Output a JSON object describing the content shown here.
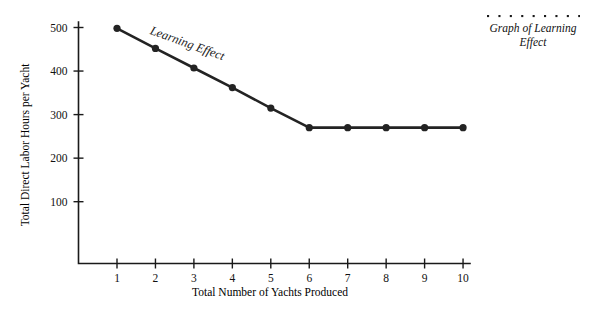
{
  "figure": {
    "caption": "Graph of Learning Effect",
    "caption_rule": "dotted-rule",
    "background_color": "#ffffff",
    "line_color": "#232323"
  },
  "chart_data": {
    "type": "line",
    "title": "",
    "subtitle": "",
    "xlabel": "Total Number of Yachts Produced",
    "ylabel": "Total Direct Labor Hours per Yacht",
    "annotation": "Learning Effect",
    "x": [
      1,
      2,
      3,
      4,
      5,
      6,
      7,
      8,
      9,
      10
    ],
    "values": [
      498,
      452,
      407,
      362,
      315,
      270,
      270,
      270,
      270,
      270
    ],
    "series": [
      {
        "name": "Total Direct Labor Hours per Yacht",
        "values": [
          498,
          452,
          407,
          362,
          315,
          270,
          270,
          270,
          270,
          270
        ]
      }
    ],
    "xtick_labels": [
      "1",
      "2",
      "3",
      "4",
      "5",
      "6",
      "7",
      "8",
      "9",
      "10"
    ],
    "ytick_labels": [
      "100",
      "200",
      "300",
      "400",
      "500"
    ],
    "ytick_values": [
      100,
      200,
      300,
      400,
      500
    ],
    "xlim": [
      0.5,
      10.4
    ],
    "ylim": [
      0,
      520
    ],
    "grid": false,
    "legend": false,
    "markers": true,
    "marker_shape": "circle"
  }
}
